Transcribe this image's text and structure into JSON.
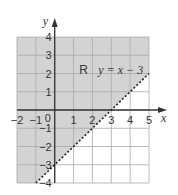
{
  "chart_data": {
    "type": "area",
    "title": "",
    "xlabel": "x",
    "ylabel": "y",
    "xlim": [
      -2,
      5
    ],
    "ylim": [
      -4,
      4
    ],
    "grid": true,
    "x_ticks": [
      -2,
      -1,
      0,
      1,
      2,
      3,
      4,
      5
    ],
    "y_ticks": [
      -4,
      -3,
      -2,
      -1,
      1,
      2,
      3,
      4
    ],
    "x_tick_labels": [
      "−2",
      "−1",
      "0",
      "1",
      "2",
      "3",
      "4",
      "5"
    ],
    "y_tick_labels": [
      "−4",
      "−3",
      "−2",
      "−1",
      "1",
      "2",
      "3",
      "4"
    ],
    "boundary": {
      "equation": "y = x − 3",
      "slope": 1,
      "intercept": -3,
      "style": "dashed"
    },
    "region": {
      "label": "R",
      "description": "y > x − 3 (shaded above the line)",
      "label_position": [
        1.3,
        2.2
      ]
    },
    "equation_label_position": [
      3.5,
      2.2
    ],
    "colors": {
      "shade": "#d3d3d3",
      "grid": "#a9a9a9",
      "axis": "#333333",
      "background": "#ffffff"
    }
  }
}
